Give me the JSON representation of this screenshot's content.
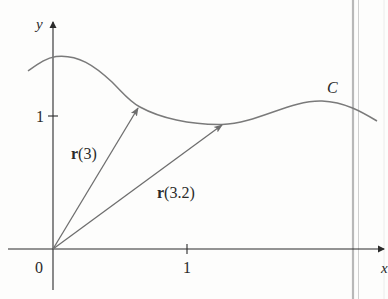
{
  "figure": {
    "type": "vector-valued function diagram",
    "colors": {
      "axis": "#2b2b2b",
      "curve": "#7a7a7a",
      "vector": "#6e6e6e",
      "text": "#2a2a2a",
      "page_edge": "#bdbdbd"
    },
    "axes": {
      "x_label": "x",
      "y_label": "y",
      "origin_label": "0",
      "x_tick_label": "1",
      "y_tick_label": "1"
    },
    "curve": {
      "label": "C"
    },
    "vectors": [
      {
        "label_bold": "r",
        "label_arg": "(3)",
        "name": "r(3)"
      },
      {
        "label_bold": "r",
        "label_arg": "(3.2)",
        "name": "r(3.2)"
      }
    ]
  }
}
